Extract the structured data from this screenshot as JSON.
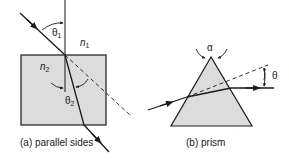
{
  "figure": {
    "panel_a": {
      "caption": "(a) parallel sides",
      "labels": {
        "theta1": "θ",
        "theta1_sub": "1",
        "n1": "n",
        "n1_sub": "1",
        "n2": "n",
        "n2_sub": "2",
        "theta2": "θ",
        "theta2_sub": "2"
      }
    },
    "panel_b": {
      "caption": "(b) prism",
      "labels": {
        "alpha": "α",
        "theta": "θ"
      }
    },
    "colors": {
      "fill": "#dcdcdc",
      "stroke": "#1a1a1a"
    }
  }
}
